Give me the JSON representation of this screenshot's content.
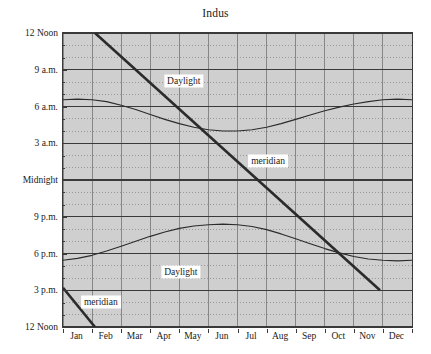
{
  "chart_data": {
    "type": "line",
    "title": "Indus",
    "xlabel": "",
    "ylabel": "",
    "grid": true,
    "legend_position": "none",
    "background_color": "#cfcfcf",
    "line_color": "#2b2b2b",
    "axis_color": "#3a3a3a",
    "categories": [
      "Jan",
      "Feb",
      "Mar",
      "Apr",
      "May",
      "Jun",
      "Jul",
      "Aug",
      "Sep",
      "Oct",
      "Nov",
      "Dec"
    ],
    "x": [
      0,
      1,
      2,
      3,
      4,
      5,
      6,
      7,
      8,
      9,
      10,
      11,
      12
    ],
    "xlim": [
      0,
      12
    ],
    "ytick_labels": [
      "12 Noon",
      "9 a.m.",
      "6 a.m.",
      "3 a.m.",
      "Midnight",
      "9 p.m.",
      "6 p.m.",
      "3 p.m.",
      "12 Noon"
    ],
    "ytick_values": [
      24,
      21,
      18,
      15,
      12,
      9,
      6,
      3,
      0
    ],
    "ylim": [
      0,
      24
    ],
    "y_minor_tick_step_hours": 1,
    "y_major_tick_step_hours": 3,
    "series": [
      {
        "name": "sunrise",
        "units": "hours since previous noon",
        "x": [
          0,
          0.5,
          1,
          1.5,
          2,
          2.5,
          3,
          3.5,
          4,
          4.5,
          5,
          5.5,
          6,
          6.5,
          7,
          7.5,
          8,
          8.5,
          9,
          9.5,
          10,
          10.5,
          11,
          11.5,
          12
        ],
        "values": [
          18.55,
          18.6,
          18.55,
          18.4,
          18.1,
          17.75,
          17.35,
          16.95,
          16.6,
          16.3,
          16.1,
          16.0,
          16.0,
          16.1,
          16.3,
          16.6,
          16.95,
          17.3,
          17.65,
          17.95,
          18.2,
          18.4,
          18.55,
          18.6,
          18.55
        ]
      },
      {
        "name": "sunset",
        "units": "hours since previous noon",
        "x": [
          0,
          0.5,
          1,
          1.5,
          2,
          2.5,
          3,
          3.5,
          4,
          4.5,
          5,
          5.5,
          6,
          6.5,
          7,
          7.5,
          8,
          8.5,
          9,
          9.5,
          10,
          10.5,
          11,
          11.5,
          12
        ],
        "values": [
          5.45,
          5.6,
          5.85,
          6.2,
          6.6,
          7.0,
          7.4,
          7.75,
          8.05,
          8.25,
          8.35,
          8.4,
          8.35,
          8.2,
          7.95,
          7.6,
          7.2,
          6.8,
          6.4,
          6.05,
          5.75,
          5.55,
          5.45,
          5.4,
          5.45
        ]
      },
      {
        "name": "meridian",
        "units": "hours since previous noon",
        "x": [
          1.1,
          10.9
        ],
        "values": [
          24,
          3
        ],
        "style": "thick-straight"
      },
      {
        "name": "meridian-lower-segment",
        "units": "hours since previous noon",
        "x": [
          0,
          1.1
        ],
        "values": [
          3.2,
          0
        ],
        "style": "thick-straight"
      }
    ],
    "annotations": [
      {
        "text": "Daylight",
        "x": 4.15,
        "y": 20.1
      },
      {
        "text": "Daylight",
        "x": 4.05,
        "y": 4.45
      },
      {
        "text": "meridian",
        "x": 7.05,
        "y": 13.55
      },
      {
        "text": "meridian",
        "x": 1.3,
        "y": 2.05
      }
    ]
  }
}
